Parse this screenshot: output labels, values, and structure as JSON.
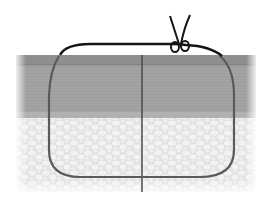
{
  "figure": {
    "type": "suture-illustration",
    "layers": [
      {
        "name": "epidermis",
        "color": "#8f8f8f"
      },
      {
        "name": "dermis",
        "color": "#a6a6a6"
      },
      {
        "name": "subcutaneous-fat",
        "color": "#e6e6e6"
      }
    ],
    "suture_color": "#1a1a1a",
    "deep_suture_color": "#5a5a5a",
    "incision_color": "#4a4a4a"
  }
}
